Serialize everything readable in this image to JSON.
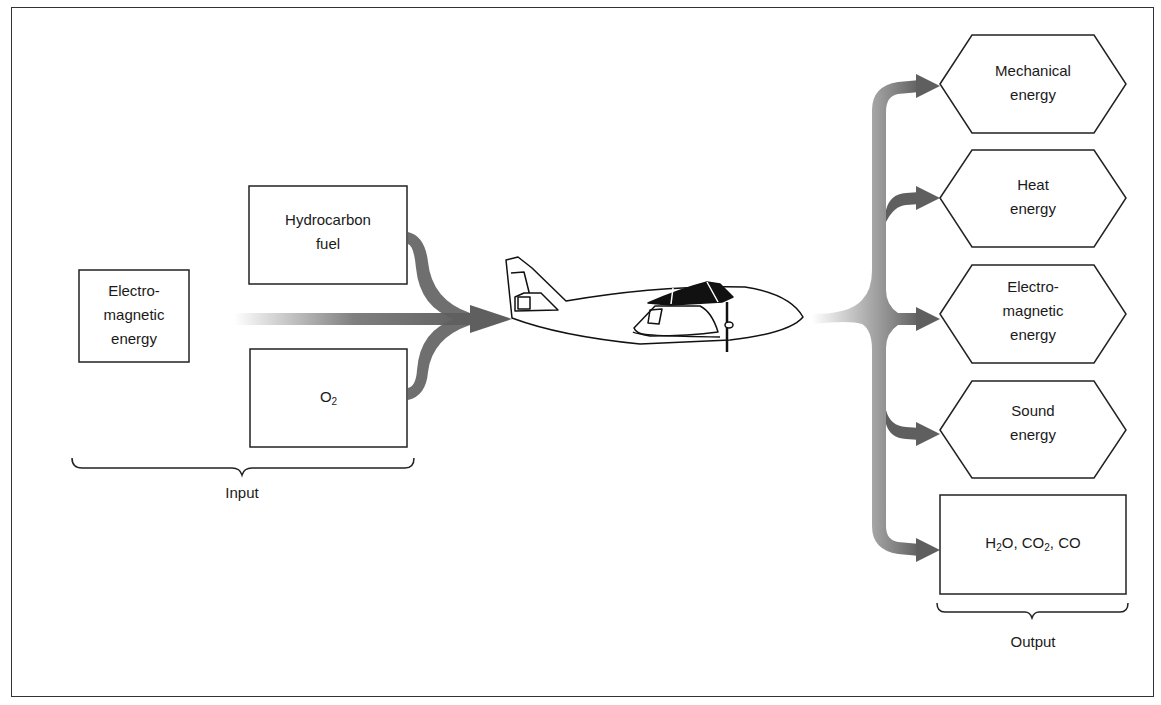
{
  "diagram": {
    "input": {
      "group_label": "Input",
      "boxes": [
        {
          "id": "electromagnetic-energy-input",
          "lines": [
            "Electro-",
            "magnetic",
            "energy"
          ]
        },
        {
          "id": "hydrocarbon-fuel",
          "lines": [
            "Hydrocarbon",
            "fuel"
          ]
        },
        {
          "id": "oxygen",
          "text": "O",
          "subscript": "2"
        }
      ]
    },
    "center": {
      "icon": "airplane-icon"
    },
    "output": {
      "group_label": "Output",
      "items": [
        {
          "id": "mechanical-energy",
          "lines": [
            "Mechanical",
            "energy"
          ]
        },
        {
          "id": "heat-energy",
          "lines": [
            "Heat",
            "energy"
          ]
        },
        {
          "id": "electromagnetic-energy-output",
          "lines": [
            "Electro-",
            "magnetic",
            "energy"
          ]
        },
        {
          "id": "sound-energy",
          "lines": [
            "Sound",
            "energy"
          ]
        },
        {
          "id": "byproducts",
          "parts": [
            "H",
            "2",
            "O, CO",
            "2",
            ", CO"
          ]
        }
      ]
    },
    "colors": {
      "arrow": "#5f5f5f",
      "line": "#222222",
      "background": "#ffffff"
    }
  }
}
